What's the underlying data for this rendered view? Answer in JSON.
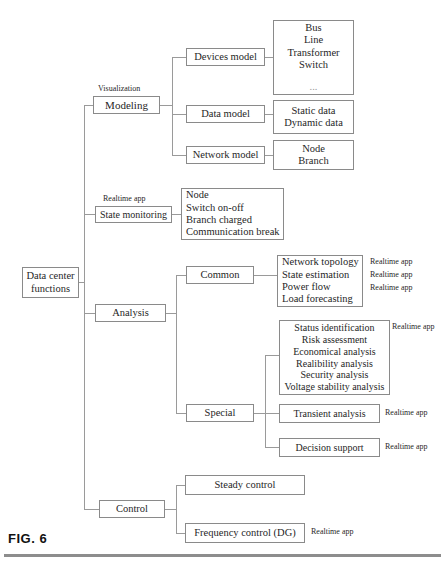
{
  "figure": {
    "label": "FIG. 6",
    "type": "tree-diagram",
    "root": "Data center functions"
  },
  "nodes": {
    "root": {
      "lines": [
        "Data center",
        "functions"
      ]
    },
    "modeling": {
      "label": "Modeling",
      "annotation": "Visualization"
    },
    "devices_model": {
      "label": "Devices model"
    },
    "devices_model_items": {
      "lines": [
        "Bus",
        "Line",
        "Transformer",
        "Switch",
        "..."
      ]
    },
    "data_model": {
      "label": "Data model"
    },
    "data_model_items": {
      "lines": [
        "Static data",
        "Dynamic data"
      ]
    },
    "network_model": {
      "label": "Network model"
    },
    "network_model_items": {
      "lines": [
        "Node",
        "Branch"
      ]
    },
    "state_monitoring": {
      "label": "State monitoring",
      "annotation": "Realtime app"
    },
    "state_monitoring_items": {
      "lines": [
        "Node",
        "Switch on-off",
        "Branch charged",
        "Communication break"
      ]
    },
    "analysis": {
      "label": "Analysis"
    },
    "common": {
      "label": "Common"
    },
    "common_items": {
      "lines": [
        "Network topology",
        "State estimation",
        "Power flow",
        "Load forecasting"
      ]
    },
    "common_tags": {
      "lines": [
        "Realtime app",
        "Realtime app",
        "Realtime app"
      ]
    },
    "special": {
      "label": "Special"
    },
    "special_items": {
      "lines": [
        "Status identification",
        "Risk assessment",
        "Economical analysis",
        "Realibility analysis",
        "Security analysis",
        "Voltage stability analysis"
      ],
      "tag": "Realtime app"
    },
    "transient_analysis": {
      "label": "Transient  analysis",
      "tag": "Realtime app"
    },
    "decision_support": {
      "label": "Decision support",
      "tag": "Realtime app"
    },
    "control": {
      "label": "Control"
    },
    "steady_control": {
      "label": "Steady control"
    },
    "frequency_control": {
      "label": "Frequency control (DG)",
      "tag": "Realtime app"
    }
  },
  "colors": {
    "box_border": "#8a8a8a",
    "connector": "#9a9a9a",
    "text": "#1f1f1f",
    "rule": "#8d8d8d",
    "background": "#ffffff"
  }
}
